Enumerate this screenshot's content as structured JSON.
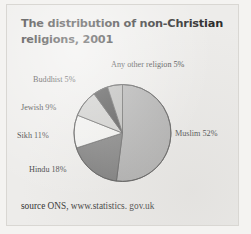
{
  "title": "The distribution of non-Christian religions, 2001",
  "source": "source ONS, www.statistics. gov.uk",
  "labels": {
    "other": "Any other religion  5%",
    "buddhist": "Buddhist  5%",
    "jewish": "Jewish 9%",
    "sikh": "Sikh 11%",
    "hindu": "Hindu 18%",
    "muslim": "Muslim 52%"
  },
  "colors": {
    "muslim": "#a8a8a8",
    "hindu": "#6e6e6e",
    "sikh": "#f2f2f0",
    "jewish": "#c9c9c7",
    "buddhist": "#3a3a3a",
    "other": "#b5b5b3",
    "outline": "#4a4a4a",
    "paper": "#edecea",
    "text": "#3a3a3a"
  },
  "chart_data": {
    "type": "pie",
    "title": "The distribution of non-Christian religions, 2001",
    "categories": [
      "Muslim",
      "Hindu",
      "Sikh",
      "Jewish",
      "Buddhist",
      "Any other religion"
    ],
    "values": [
      52,
      18,
      11,
      9,
      5,
      5
    ],
    "unit": "%",
    "start_angle_deg": 0,
    "direction": "clockwise",
    "legend": "none",
    "data_labels": [
      "Muslim 52%",
      "Hindu 18%",
      "Sikh 11%",
      "Jewish 9%",
      "Buddhist  5%",
      "Any other religion  5%"
    ],
    "slice_colors": [
      "#a8a8a8",
      "#6e6e6e",
      "#f2f2f0",
      "#c9c9c7",
      "#3a3a3a",
      "#b5b5b3"
    ],
    "source_note": "source ONS, www.statistics. gov.uk"
  }
}
